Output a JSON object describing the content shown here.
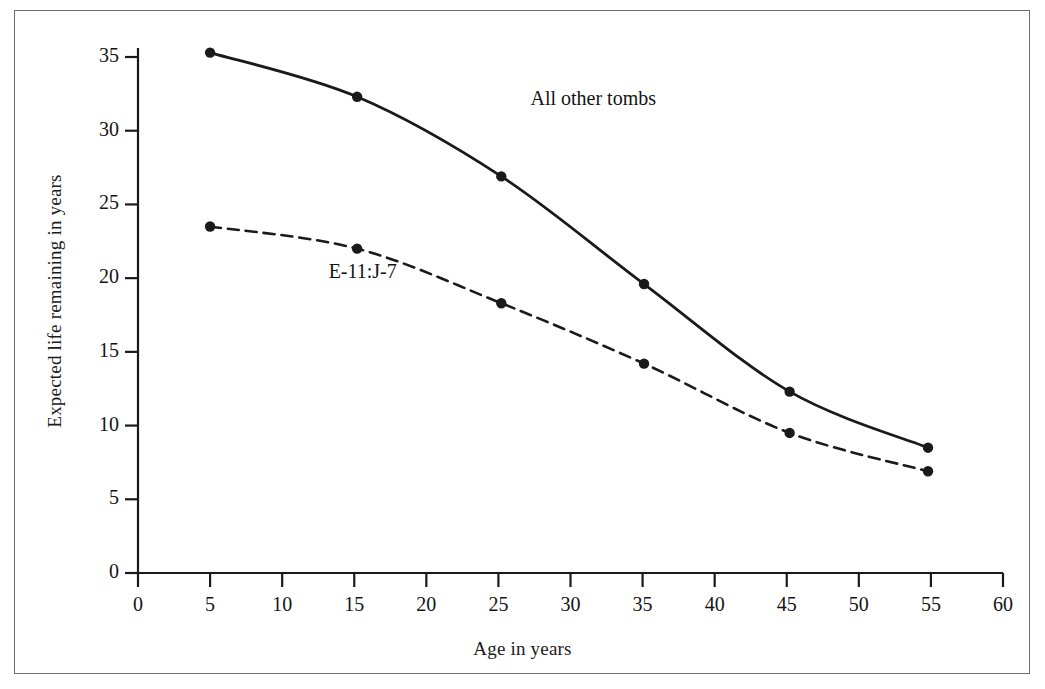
{
  "chart_data": {
    "type": "line",
    "title": "",
    "subtitle": "",
    "xlabel": "Age in years",
    "ylabel": "Expected life remaining in years",
    "xlim": [
      0,
      60
    ],
    "ylim": [
      0,
      35
    ],
    "xticks": [
      0,
      5,
      10,
      15,
      20,
      25,
      30,
      35,
      40,
      45,
      50,
      55,
      60
    ],
    "xtick_labels": [
      "0",
      "5",
      "10",
      "15",
      "20",
      "25",
      "30",
      "35",
      "40",
      "45",
      "50",
      "55",
      "60"
    ],
    "yticks": [
      0,
      5,
      10,
      15,
      20,
      25,
      30,
      35
    ],
    "ytick_labels": [
      "0",
      "5",
      "10",
      "15",
      "20",
      "25",
      "30",
      "35"
    ],
    "grid": false,
    "legend": "inline-annotations",
    "series": [
      {
        "name": "All other tombs",
        "style": "solid",
        "color": "#1a1a1a",
        "marker": "filled-circle",
        "label_x": 27.5,
        "label_y": 32.0,
        "x": [
          5.0,
          15.2,
          25.2,
          35.1,
          45.2,
          54.8
        ],
        "y": [
          35.3,
          32.3,
          26.9,
          19.6,
          12.3,
          8.5
        ]
      },
      {
        "name": "E-11:J-7",
        "style": "dashed",
        "color": "#1a1a1a",
        "marker": "filled-circle",
        "label_x": 13.5,
        "label_y": 20.3,
        "x": [
          5.0,
          15.2,
          25.2,
          35.1,
          45.2,
          54.8
        ],
        "y": [
          23.5,
          22.0,
          18.3,
          14.2,
          9.5,
          6.9
        ]
      }
    ]
  },
  "figure": {
    "axis_color": "#1a1a1a",
    "background": "#ffffff",
    "border_color": "#6e6e6e"
  }
}
